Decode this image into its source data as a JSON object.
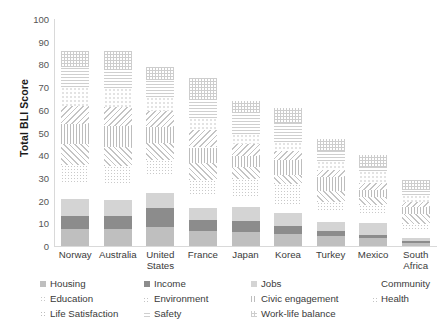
{
  "chart_data": {
    "type": "bar",
    "title": "",
    "xlabel": "",
    "ylabel": "Total BLI Score",
    "ylim": [
      0,
      100
    ],
    "yticks": [
      0,
      10,
      20,
      30,
      40,
      50,
      60,
      70,
      80,
      90,
      100
    ],
    "grid": false,
    "stacked": true,
    "legend_position": "bottom",
    "categories": [
      "Norway",
      "Australia",
      "United States",
      "France",
      "Japan",
      "Korea",
      "Turkey",
      "Mexico",
      "South Africa"
    ],
    "series": [
      {
        "name": "Housing",
        "values": [
          7.4,
          7.5,
          8.2,
          6.6,
          6.3,
          5.3,
          4.2,
          3.4,
          1.4
        ]
      },
      {
        "name": "Income",
        "values": [
          6.0,
          5.6,
          8.4,
          5.0,
          4.6,
          3.6,
          2.4,
          1.6,
          0.9
        ]
      },
      {
        "name": "Jobs",
        "values": [
          7.1,
          7.2,
          6.8,
          5.1,
          6.1,
          5.7,
          3.9,
          5.0,
          1.1
        ]
      },
      {
        "name": "Community",
        "values": [
          6.9,
          7.3,
          7.4,
          5.8,
          5.2,
          4.0,
          4.6,
          4.5,
          3.6
        ]
      },
      {
        "name": "Education",
        "values": [
          8.3,
          7.8,
          7.1,
          6.5,
          7.2,
          8.6,
          4.2,
          3.5,
          2.8
        ]
      },
      {
        "name": "Environment",
        "values": [
          9.3,
          8.2,
          7.6,
          7.4,
          5.5,
          4.3,
          5.0,
          3.7,
          4.2
        ]
      },
      {
        "name": "Civic engagement",
        "values": [
          8.6,
          9.1,
          6.9,
          7.0,
          4.8,
          6.4,
          6.1,
          3.1,
          3.4
        ]
      },
      {
        "name": "Health",
        "values": [
          8.0,
          8.6,
          7.0,
          7.5,
          5.4,
          4.0,
          3.2,
          2.8,
          2.1
        ]
      },
      {
        "name": "Life Satisfaction",
        "values": [
          8.5,
          8.1,
          6.4,
          5.6,
          4.2,
          3.8,
          3.9,
          5.5,
          3.1
        ]
      },
      {
        "name": "Safety",
        "values": [
          8.6,
          8.2,
          7.3,
          7.9,
          9.2,
          8.6,
          4.3,
          1.9,
          2.0
        ]
      },
      {
        "name": "Work-life balance",
        "values": [
          7.3,
          8.4,
          5.9,
          9.6,
          5.5,
          6.7,
          5.2,
          5.0,
          4.4
        ]
      }
    ],
    "totals": [
      90,
      88,
      87,
      74,
      64,
      61,
      47,
      40,
      29
    ]
  },
  "axis": {
    "y_title": "Total BLI Score",
    "y_ticks": [
      "100",
      "90",
      "80",
      "70",
      "60",
      "50",
      "40",
      "30",
      "20",
      "10",
      "0"
    ],
    "x_labels": [
      {
        "line1": "Norway",
        "line2": ""
      },
      {
        "line1": "Australia",
        "line2": ""
      },
      {
        "line1": "United",
        "line2": "States"
      },
      {
        "line1": "France",
        "line2": ""
      },
      {
        "line1": "Japan",
        "line2": ""
      },
      {
        "line1": "Korea",
        "line2": ""
      },
      {
        "line1": "Turkey",
        "line2": ""
      },
      {
        "line1": "Mexico",
        "line2": ""
      },
      {
        "line1": "South",
        "line2": "Africa"
      }
    ]
  },
  "legend": {
    "rows": [
      [
        "Housing",
        "Income",
        "Jobs",
        "Community"
      ],
      [
        "Education",
        "Environment",
        "Civic engagement",
        "Health"
      ],
      [
        "Life Satisfaction",
        "Safety",
        "Work-life balance"
      ]
    ]
  },
  "colors": {
    "housing": "#bfbfbf",
    "income": "#8c8c8c",
    "jobs": "#d4d4d4",
    "community": "#ffffff",
    "pattern_gray": "#c4c4c4",
    "axis": "#d9d9d9",
    "text": "#3a3a3a"
  }
}
